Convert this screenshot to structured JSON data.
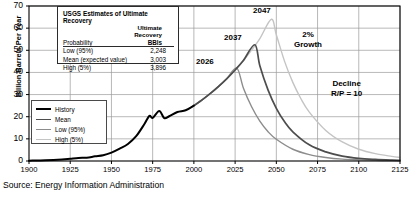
{
  "source_note": "Source: Energy Information Administration",
  "usgs_table": {
    "title": "USGS Estimates of Ultimate Recovery",
    "sub_header_lines": [
      "Ultimate",
      "Recovery"
    ],
    "col_headers": [
      "Probability",
      "BBls"
    ],
    "rows": [
      {
        "label": "Low (95%)",
        "value": "2,248"
      },
      {
        "label": "Mean (expected value)",
        "value": "3,003"
      },
      {
        "label": "High (5%)",
        "value": "3,896"
      }
    ]
  },
  "legend": {
    "items": [
      {
        "label": "History",
        "color": "#000000",
        "width": 2.0
      },
      {
        "label": "Mean",
        "color": "#4d4d4d",
        "width": 1.6
      },
      {
        "label": "Low (95%)",
        "color": "#8c8c8c",
        "width": 1.3
      },
      {
        "label": "High (5%)",
        "color": "#c4c4c4",
        "width": 1.3
      }
    ]
  },
  "annotations": [
    {
      "name": "peak-label-2026",
      "text": "2026",
      "x": 196,
      "y": 57
    },
    {
      "name": "peak-label-2037",
      "text": "2037",
      "x": 224,
      "y": 33
    },
    {
      "name": "peak-label-2047",
      "text": "2047",
      "x": 253,
      "y": 6
    },
    {
      "name": "growth-label",
      "text": "2%\nGrowth",
      "x": 294,
      "y": 30
    },
    {
      "name": "decline-label",
      "text": "Decline\nR/P = 10",
      "x": 331,
      "y": 79
    }
  ],
  "chart_data": {
    "type": "line",
    "title": "",
    "xlabel": "",
    "ylabel": "Billion Barrels Per Year",
    "xlim": [
      1900,
      2125
    ],
    "ylim": [
      0,
      70
    ],
    "grid": true,
    "legend_position": "lower-left-inside",
    "xticks": [
      1900,
      1925,
      1950,
      1975,
      2000,
      2025,
      2050,
      2075,
      2100,
      2125
    ],
    "yticks": [
      0,
      10,
      20,
      30,
      40,
      50,
      60,
      70
    ],
    "growth_rate_pct": 2,
    "decline_rp_ratio": 10,
    "peaks": [
      {
        "series": "Low (95%)",
        "year": 2026,
        "value": 42.0
      },
      {
        "series": "Mean",
        "year": 2037,
        "value": 52.5
      },
      {
        "series": "High (5%)",
        "year": 2047,
        "value": 64.0
      }
    ],
    "series": [
      {
        "name": "History",
        "color": "#000000",
        "x": [
          1900,
          1910,
          1920,
          1925,
          1930,
          1935,
          1940,
          1945,
          1950,
          1955,
          1960,
          1965,
          1970,
          1973,
          1975,
          1979,
          1982,
          1985,
          1990,
          1995,
          2000
        ],
        "values": [
          0.15,
          0.3,
          0.7,
          1.05,
          1.4,
          1.5,
          2.1,
          2.6,
          3.8,
          5.6,
          7.7,
          11.2,
          16.7,
          20.4,
          19.5,
          22.6,
          19.4,
          20.2,
          22.1,
          22.9,
          25.0
        ]
      },
      {
        "name": "Low (95%)",
        "color": "#8c8c8c",
        "x": [
          2000,
          2005,
          2010,
          2015,
          2020,
          2026,
          2030,
          2035,
          2040,
          2045,
          2050,
          2060,
          2070,
          2080,
          2090,
          2100,
          2110,
          2120,
          2125
        ],
        "values": [
          25.0,
          27.6,
          30.5,
          33.7,
          37.2,
          42.0,
          33.0,
          24.5,
          18.0,
          13.2,
          9.8,
          5.3,
          2.9,
          1.6,
          0.85,
          0.5,
          0.3,
          0.2,
          0.15
        ]
      },
      {
        "name": "Mean",
        "color": "#4d4d4d",
        "x": [
          2000,
          2005,
          2010,
          2015,
          2020,
          2025,
          2030,
          2037,
          2040,
          2045,
          2050,
          2055,
          2060,
          2070,
          2080,
          2090,
          2100,
          2110,
          2120,
          2125
        ],
        "values": [
          25.0,
          27.6,
          30.5,
          33.7,
          37.2,
          41.1,
          45.4,
          52.5,
          43.0,
          32.0,
          23.8,
          17.7,
          13.2,
          7.3,
          4.1,
          2.2,
          1.2,
          0.7,
          0.4,
          0.3
        ]
      },
      {
        "name": "High (5%)",
        "color": "#c4c4c4",
        "x": [
          2000,
          2005,
          2010,
          2015,
          2020,
          2025,
          2030,
          2035,
          2040,
          2047,
          2050,
          2055,
          2060,
          2065,
          2070,
          2080,
          2090,
          2100,
          2110,
          2120,
          2125
        ],
        "values": [
          25.0,
          27.6,
          30.5,
          33.7,
          37.2,
          41.1,
          45.4,
          50.1,
          55.3,
          64.0,
          57.0,
          45.0,
          35.5,
          28.0,
          22.1,
          13.8,
          8.6,
          5.3,
          3.3,
          2.1,
          1.6
        ]
      }
    ]
  }
}
